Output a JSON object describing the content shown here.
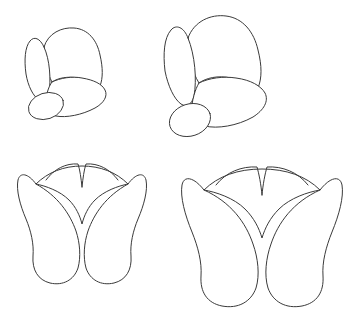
{
  "document": {
    "title": "Three-lobed petal structure line drawings",
    "background_color": "#ffffff",
    "stroke_color": "#3a3a3a",
    "stroke_width": 1,
    "width": 362,
    "height": 314,
    "panel_count": 4,
    "layout": "2x2 grid"
  },
  "figures": [
    {
      "id": "top-left",
      "name": "oblique-view-small",
      "view": "oblique",
      "scale": "small",
      "lobe_count": 3,
      "has_base_ellipse": true,
      "bounds": {
        "x": 22,
        "y": 25,
        "width": 88,
        "height": 95
      },
      "base_ellipse": {
        "cx": 46,
        "cy": 106,
        "rx": 18,
        "ry": 13,
        "rotation": -18
      },
      "parts": [
        {
          "name": "left-lobe",
          "description": "narrow elongated upright lobe"
        },
        {
          "name": "upper-right-lobe",
          "description": "broad dome-shaped lobe"
        },
        {
          "name": "lower-right-lobe",
          "description": "tilted oval lobe extending down-right"
        }
      ]
    },
    {
      "id": "top-right",
      "name": "oblique-view-large",
      "view": "oblique",
      "scale": "large",
      "lobe_count": 3,
      "has_base_ellipse": true,
      "bounds": {
        "x": 160,
        "y": 14,
        "width": 112,
        "height": 123
      },
      "base_ellipse": {
        "cx": 190,
        "cy": 120,
        "rx": 21,
        "ry": 16,
        "rotation": -18
      },
      "parts": [
        {
          "name": "left-lobe",
          "description": "narrow elongated upright lobe"
        },
        {
          "name": "upper-right-lobe",
          "description": "broad dome-shaped lobe"
        },
        {
          "name": "lower-right-lobe",
          "description": "tilted oval lobe extending down-right"
        }
      ]
    },
    {
      "id": "bottom-left",
      "name": "frontal-view-small",
      "view": "frontal",
      "scale": "small",
      "lobe_count": 3,
      "has_base_ellipse": false,
      "symmetry": "bilateral",
      "bounds": {
        "x": 18,
        "y": 163,
        "width": 128,
        "height": 122
      },
      "parts": [
        {
          "name": "left-outer-lobe",
          "description": "curved lobe sweeping from upper-left to lower-center"
        },
        {
          "name": "right-outer-lobe",
          "description": "curved lobe sweeping from upper-right to lower-center"
        },
        {
          "name": "center-crown-arcs",
          "description": "two scalloped arcs meeting at top center"
        },
        {
          "name": "inner-arc",
          "description": "wide arc spanning beneath the crown"
        }
      ]
    },
    {
      "id": "bottom-right",
      "name": "frontal-view-large",
      "view": "frontal",
      "scale": "large",
      "lobe_count": 3,
      "has_base_ellipse": false,
      "symmetry": "bilateral",
      "bounds": {
        "x": 182,
        "y": 166,
        "width": 160,
        "height": 138
      },
      "parts": [
        {
          "name": "left-outer-lobe",
          "description": "curved lobe sweeping from upper-left to lower-center"
        },
        {
          "name": "right-outer-lobe",
          "description": "curved lobe sweeping from upper-right to lower-center"
        },
        {
          "name": "center-crown-arcs",
          "description": "two scalloped arcs meeting at top center"
        },
        {
          "name": "inner-arc",
          "description": "wide arc spanning beneath the crown"
        }
      ]
    }
  ]
}
